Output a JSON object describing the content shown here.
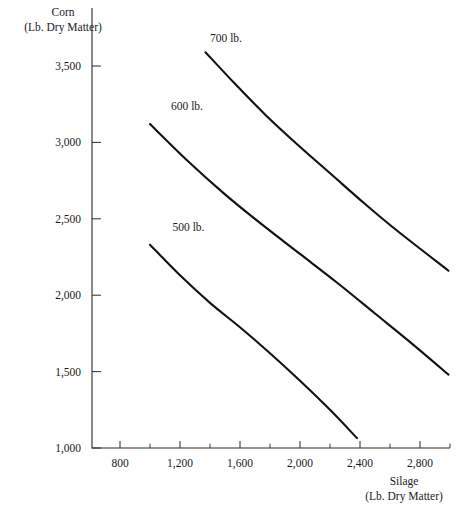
{
  "chart_data": {
    "type": "line",
    "title": "",
    "subtitle": "",
    "xlabel": "Silage",
    "xlabel_sub": "(Lb. Dry Matter)",
    "ylabel": "Corn",
    "ylabel_sub": "(Lb. Dry Matter)",
    "xlim": [
      600,
      3000
    ],
    "ylim": [
      900,
      3700
    ],
    "grid": false,
    "legend_position": "inline-curve-labels",
    "x_ticks_major": [
      800,
      1200,
      1600,
      2000,
      2400,
      2800
    ],
    "x_ticks_major_labels": [
      "800",
      "1,200",
      "1,600",
      "2,000",
      "2,400",
      "2,800"
    ],
    "x_ticks_minor": [
      1000,
      1400,
      1800,
      2200,
      2600,
      3000
    ],
    "y_ticks_major": [
      1000,
      1500,
      2000,
      2500,
      3000,
      3500
    ],
    "y_ticks_major_labels": [
      "1,000",
      "1,500",
      "2,000",
      "2,500",
      "3,000",
      "3,500"
    ],
    "series": [
      {
        "name": "500 lb.",
        "label": "500 lb.",
        "label_x": 1150,
        "label_y": 2420,
        "color": "#111111",
        "x": [
          1000,
          1200,
          1400,
          1600,
          1800,
          2000,
          2200,
          2380
        ],
        "y": [
          2330,
          2130,
          1950,
          1790,
          1620,
          1440,
          1250,
          1065
        ]
      },
      {
        "name": "600 lb.",
        "label": "600 lb.",
        "label_x": 1140,
        "label_y": 3210,
        "color": "#111111",
        "x": [
          1000,
          1250,
          1500,
          1750,
          2000,
          2250,
          2500,
          2750,
          2990
        ],
        "y": [
          3120,
          2880,
          2660,
          2460,
          2270,
          2080,
          1880,
          1680,
          1480
        ]
      },
      {
        "name": "700 lb.",
        "label": "700 lb.",
        "label_x": 1400,
        "label_y": 3660,
        "color": "#111111",
        "x": [
          1370,
          1570,
          1770,
          1990,
          2210,
          2430,
          2650,
          2990
        ],
        "y": [
          3590,
          3380,
          3180,
          2980,
          2790,
          2600,
          2420,
          2160
        ]
      }
    ]
  }
}
